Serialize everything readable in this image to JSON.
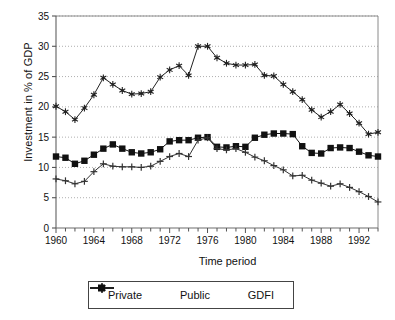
{
  "chart_data": {
    "type": "line",
    "title": "",
    "xlabel": "Time period",
    "ylabel": "Investment in % of GDP",
    "xlim": [
      1960,
      1994
    ],
    "ylim": [
      0,
      35
    ],
    "ytick_step": 5,
    "yticks": [
      0,
      5,
      10,
      15,
      20,
      25,
      30,
      35
    ],
    "xticks_major": [
      1960,
      1964,
      1968,
      1972,
      1976,
      1980,
      1984,
      1988,
      1992
    ],
    "xtick_minor_step": 1,
    "grid": "horizontal-dotted",
    "legend_position": "below-center",
    "x": [
      1960,
      1961,
      1962,
      1963,
      1964,
      1965,
      1966,
      1967,
      1968,
      1969,
      1970,
      1971,
      1972,
      1973,
      1974,
      1975,
      1976,
      1977,
      1978,
      1979,
      1980,
      1981,
      1982,
      1983,
      1984,
      1985,
      1986,
      1987,
      1988,
      1989,
      1990,
      1991,
      1992,
      1993,
      1994
    ],
    "series": [
      {
        "name": "Private",
        "marker": "filled-square",
        "color": "#111111",
        "values": [
          11.8,
          11.6,
          10.6,
          11.1,
          12.1,
          13.1,
          13.8,
          13.1,
          12.5,
          12.3,
          12.5,
          13.0,
          14.3,
          14.5,
          14.5,
          14.9,
          15.0,
          13.4,
          13.3,
          13.5,
          13.4,
          14.9,
          15.4,
          15.6,
          15.6,
          15.5,
          13.5,
          12.4,
          12.3,
          13.2,
          13.3,
          13.2,
          12.6,
          12.0,
          11.8
        ]
      },
      {
        "name": "Public",
        "marker": "plus",
        "color": "#333333",
        "values": [
          8.1,
          7.8,
          7.3,
          7.7,
          9.3,
          10.6,
          10.2,
          10.1,
          10.1,
          10.0,
          10.2,
          11.0,
          11.8,
          12.3,
          11.8,
          14.5,
          14.9,
          13.1,
          12.9,
          13.1,
          12.5,
          11.7,
          11.1,
          10.3,
          9.6,
          8.6,
          8.7,
          7.9,
          7.4,
          6.9,
          7.3,
          6.7,
          6.0,
          5.2,
          4.3
        ]
      },
      {
        "name": "GDFI",
        "marker": "star",
        "color": "#222222",
        "values": [
          20.1,
          19.2,
          17.9,
          19.8,
          22.0,
          24.8,
          23.7,
          22.7,
          22.1,
          22.2,
          22.5,
          24.9,
          26.1,
          26.8,
          25.2,
          30.0,
          30.0,
          28.1,
          27.2,
          26.9,
          26.9,
          27.0,
          25.2,
          25.1,
          23.7,
          22.5,
          21.2,
          19.5,
          18.3,
          19.2,
          20.4,
          18.9,
          17.3,
          15.5,
          15.8
        ]
      }
    ]
  },
  "legend": {
    "items": [
      {
        "label": "Private",
        "marker": "filled-square"
      },
      {
        "label": "Public",
        "marker": "plus"
      },
      {
        "label": "GDFI",
        "marker": "star"
      }
    ]
  },
  "axis": {
    "y_title": "Investment in % of GDP",
    "x_title": "Time period"
  }
}
